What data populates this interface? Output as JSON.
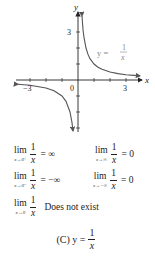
{
  "graph": {
    "function_label_lhs": "y =",
    "function_label_num": "1",
    "function_label_den": "x",
    "x_axis_label": "x",
    "y_axis_label": "y",
    "x_tick_labels": [
      "−3",
      "0",
      "3"
    ],
    "y_tick_labels": [
      "3"
    ],
    "curve_color": "#555555",
    "axis_color": "#222222",
    "label_color": "#888888"
  },
  "limits": [
    {
      "lim": "lim",
      "sub": "x→0⁺",
      "num": "1",
      "den": "x",
      "result": "= ∞"
    },
    {
      "lim": "lim",
      "sub": "x→∞",
      "num": "1",
      "den": "x",
      "result": "= 0"
    },
    {
      "lim": "lim",
      "sub": "x→0⁻",
      "num": "1",
      "den": "x",
      "result": "= −∞"
    },
    {
      "lim": "lim",
      "sub": "x→−∞",
      "num": "1",
      "den": "x",
      "result": "= 0"
    },
    {
      "lim": "lim",
      "sub": "x→0",
      "num": "1",
      "den": "x",
      "result": "Does not exist"
    }
  ],
  "caption": {
    "prefix": "(C)  y =",
    "num": "1",
    "den": "x"
  }
}
